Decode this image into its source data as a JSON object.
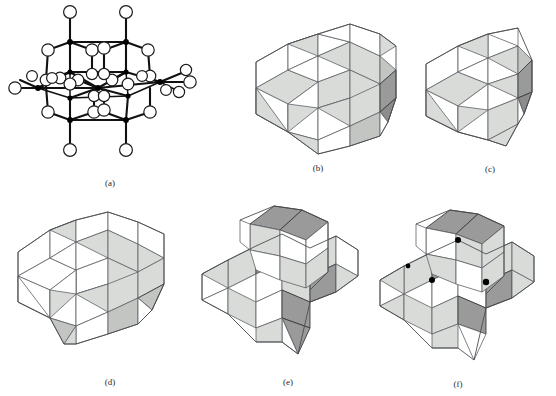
{
  "figure": {
    "kind": "crystal-structure-figure",
    "background": "#ffffff",
    "panel_count": 6,
    "colors": {
      "face_white": "#ffffff",
      "face_light_gray": "#d9dbd9",
      "face_mid_gray": "#c3c5c3",
      "face_dark_gray": "#9a9a9a",
      "edge_gray": "#5f6166",
      "bond_black": "#111111",
      "atom_fill": "#ffffff",
      "metal_center": "#000000"
    }
  },
  "panels": [
    {
      "id": "a",
      "caption": "(a)",
      "style": "ball-and-stick",
      "description": "ball-and-stick cluster with open circles and black metal centers",
      "atom_count": 30,
      "metal_count": 10
    },
    {
      "id": "b",
      "caption": "(b)",
      "style": "polyhedral",
      "description": "edge-sharing octahedra slab, three by two block",
      "octahedra_columns": 3,
      "octahedra_rows": 2,
      "shading": "white and light gray"
    },
    {
      "id": "c",
      "caption": "(c)",
      "style": "polyhedral",
      "description": "edge-sharing octahedra slab, two by two block",
      "octahedra_columns": 2,
      "octahedra_rows": 2,
      "shading": "white and light gray"
    },
    {
      "id": "d",
      "caption": "(d)",
      "style": "polyhedral",
      "description": "open corner and edge sharing octahedra, three by two block",
      "octahedra_columns": 3,
      "octahedra_rows": 2,
      "shading": "white and light gray"
    },
    {
      "id": "e",
      "caption": "(e)",
      "style": "polyhedral",
      "description": "two offset octahedra blocks with dark gray and light gray faces",
      "octahedra_columns": 3,
      "octahedra_rows": 2,
      "shading": "white, light gray and dark gray"
    },
    {
      "id": "f",
      "caption": "(f)",
      "style": "polyhedral",
      "description": "two offset octahedra blocks with dark gray faces and black vertex dots",
      "octahedra_columns": 3,
      "octahedra_rows": 2,
      "shading": "white, light gray and dark gray",
      "vertex_dots": 4
    }
  ],
  "captions": {
    "a": "(a)",
    "b": "(b)",
    "c": "(c)",
    "d": "(d)",
    "e": "(e)",
    "f": "(f)"
  }
}
